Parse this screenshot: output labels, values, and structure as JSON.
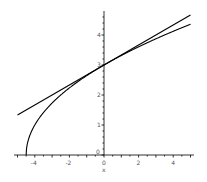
{
  "chart_data": {
    "type": "line",
    "title": "",
    "xlabel": "x",
    "ylabel": "",
    "xlim": [
      -5,
      5
    ],
    "ylim": [
      0,
      5
    ],
    "grid": false,
    "x_ticks": [
      -4,
      -2,
      0,
      2,
      4
    ],
    "y_ticks": [
      1,
      2,
      3,
      4
    ],
    "x_tick_labels": [
      "-4",
      "-2",
      "0",
      "2",
      "4"
    ],
    "y_tick_labels": [
      "1",
      "2",
      "3",
      "4"
    ],
    "series": [
      {
        "name": "curve sqrt(2x+9)",
        "x": [
          -4.5,
          -4.4,
          -4.0,
          -3.0,
          -2.0,
          -1.0,
          0,
          1,
          2,
          3,
          4,
          5
        ],
        "y": [
          0,
          0.45,
          1.0,
          1.73,
          2.24,
          2.65,
          3.0,
          3.32,
          3.61,
          3.87,
          4.12,
          4.36
        ]
      },
      {
        "name": "tangent line y = 3 + x/3",
        "x": [
          -5,
          5
        ],
        "y": [
          1.33,
          4.67
        ]
      }
    ]
  },
  "axis": {
    "x_label": "x",
    "origin_label": "0"
  }
}
